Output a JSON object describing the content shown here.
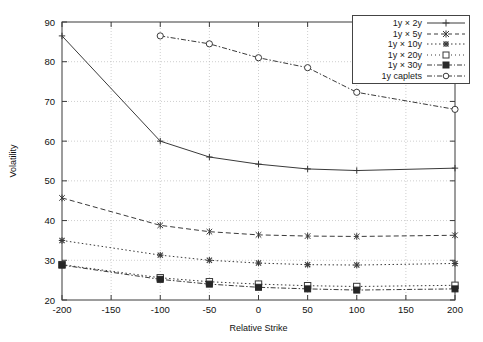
{
  "chart_data": {
    "type": "line",
    "title": "",
    "xlabel": "Relative Strike",
    "ylabel": "Volatility",
    "xlim": [
      -200,
      200
    ],
    "ylim": [
      20,
      90
    ],
    "xticks": [
      -200,
      -150,
      -100,
      -50,
      0,
      50,
      100,
      150,
      200
    ],
    "xticklabels": [
      "-200",
      "-150",
      "-100",
      "-50",
      "0",
      "50",
      "100",
      "150",
      "200"
    ],
    "yticks": [
      20,
      30,
      40,
      50,
      60,
      70,
      80,
      90
    ],
    "yticklabels": [
      "20",
      "30",
      "40",
      "50",
      "60",
      "70",
      "80",
      "90"
    ],
    "grid": true,
    "legend_position": "upper right",
    "series": [
      {
        "name": "1y × 2y",
        "marker": "plus",
        "dash": "solid",
        "x": [
          -200,
          -100,
          -50,
          0,
          50,
          100,
          200
        ],
        "y": [
          86.5,
          60.0,
          56.0,
          54.2,
          53.0,
          52.6,
          53.2
        ]
      },
      {
        "name": "1y × 5y",
        "marker": "cross-star",
        "dash": "dashed",
        "x": [
          -200,
          -100,
          -50,
          0,
          50,
          100,
          200
        ],
        "y": [
          45.7,
          38.8,
          37.2,
          36.4,
          36.1,
          36.0,
          36.3
        ]
      },
      {
        "name": "1y × 10y",
        "marker": "star",
        "dash": "dotted",
        "x": [
          -200,
          -100,
          -50,
          0,
          50,
          100,
          200
        ],
        "y": [
          35.0,
          31.3,
          30.0,
          29.3,
          28.9,
          28.8,
          29.2
        ]
      },
      {
        "name": "1y × 20y",
        "marker": "open-square",
        "dash": "dotted",
        "x": [
          -200,
          -100,
          -50,
          0,
          50,
          100,
          200
        ],
        "y": [
          28.9,
          25.6,
          24.6,
          24.0,
          23.6,
          23.4,
          23.7
        ]
      },
      {
        "name": "1y × 30y",
        "marker": "filled-square",
        "dash": "dash-dot",
        "x": [
          -200,
          -100,
          -50,
          0,
          50,
          100,
          200
        ],
        "y": [
          28.8,
          25.2,
          24.0,
          23.2,
          22.8,
          22.5,
          22.8
        ]
      },
      {
        "name": "1y caplets",
        "marker": "open-circle",
        "dash": "dash-dot",
        "x": [
          -100,
          -50,
          0,
          50,
          100,
          200
        ],
        "y": [
          86.5,
          84.5,
          81.0,
          78.5,
          72.3,
          68.0
        ]
      }
    ]
  },
  "legend": {
    "items": [
      {
        "label": "1y × 2y"
      },
      {
        "label": "1y × 5y"
      },
      {
        "label": "1y × 10y"
      },
      {
        "label": "1y × 20y"
      },
      {
        "label": "1y × 30y"
      },
      {
        "label": "1y caplets"
      }
    ]
  },
  "colors": {
    "axis": "#3b3b3b",
    "grid": "#b9b9b9",
    "data": "#3a3a3a",
    "background": "#ffffff"
  }
}
